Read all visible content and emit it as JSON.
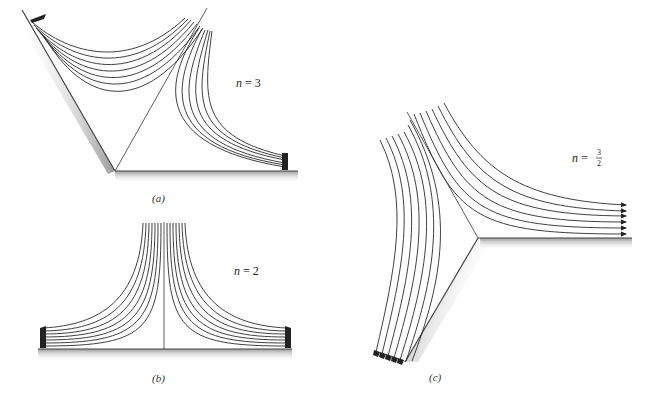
{
  "figure": {
    "panels": [
      {
        "id": "a",
        "caption": "(a)",
        "label_var": "n",
        "label_eq": "=",
        "label_value": "3",
        "description": "Flow in a corner with wedge walls; streamlines with arrows"
      },
      {
        "id": "b",
        "caption": "(b)",
        "label_var": "n",
        "label_eq": "=",
        "label_value": "2",
        "description": "Stagnation point flow against a flat wall"
      },
      {
        "id": "c",
        "caption": "(c)",
        "label_var": "n",
        "label_eq": "=",
        "label_num": "3",
        "label_den": "2",
        "description": "Flow around a 90-degree corner (exterior angle)"
      }
    ],
    "colors": {
      "line": "#2a2a2a",
      "wall": "#555555",
      "wall_shadow": "#bdbdbd"
    }
  }
}
